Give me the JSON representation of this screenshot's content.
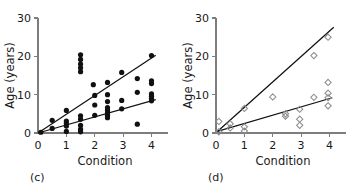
{
  "figure": {
    "panels": [
      {
        "tag": "(c)",
        "marker_style": "filled-circle",
        "xlabel": "Condition",
        "ylabel": "Age (years)",
        "xticks": [
          0,
          1,
          2,
          3,
          4
        ],
        "yticks": [
          0,
          10,
          20,
          30
        ],
        "xlim": [
          0,
          4.3
        ],
        "ylim": [
          0,
          30
        ],
        "lines": [
          {
            "name": "upper-regression",
            "x0": 0,
            "y0": 0,
            "x1": 4.15,
            "y1": 20.3
          },
          {
            "name": "lower-regression",
            "x0": 0,
            "y0": 0,
            "x1": 4.15,
            "y1": 8.7
          }
        ],
        "points": [
          [
            0.1,
            0.2
          ],
          [
            0.5,
            3.3
          ],
          [
            0.5,
            1.2
          ],
          [
            1.0,
            5.9
          ],
          [
            1.0,
            3.1
          ],
          [
            1.0,
            2.5
          ],
          [
            1.0,
            1.8
          ],
          [
            1.0,
            0.4
          ],
          [
            1.5,
            20.4
          ],
          [
            1.5,
            19.2
          ],
          [
            1.5,
            18.0
          ],
          [
            1.5,
            17.0
          ],
          [
            1.5,
            16.0
          ],
          [
            1.5,
            4.5
          ],
          [
            1.5,
            3.6
          ],
          [
            1.5,
            2.0
          ],
          [
            1.5,
            1.0
          ],
          [
            1.5,
            0.3
          ],
          [
            1.95,
            12.6
          ],
          [
            2.0,
            9.8
          ],
          [
            2.0,
            7.3
          ],
          [
            2.0,
            4.6
          ],
          [
            2.45,
            13.2
          ],
          [
            2.45,
            10.0
          ],
          [
            2.45,
            8.2
          ],
          [
            2.45,
            6.6
          ],
          [
            2.45,
            5.9
          ],
          [
            2.45,
            5.2
          ],
          [
            2.45,
            4.6
          ],
          [
            2.45,
            4.0
          ],
          [
            2.95,
            15.8
          ],
          [
            2.95,
            8.5
          ],
          [
            2.95,
            6.3
          ],
          [
            3.5,
            14.2
          ],
          [
            3.5,
            10.6
          ],
          [
            3.5,
            2.3
          ],
          [
            4.0,
            20.2
          ],
          [
            4.0,
            13.6
          ],
          [
            4.0,
            12.9
          ],
          [
            4.0,
            10.2
          ],
          [
            4.0,
            9.6
          ],
          [
            4.0,
            9.0
          ],
          [
            4.0,
            8.4
          ]
        ]
      },
      {
        "tag": "(d)",
        "marker_style": "open-diamond",
        "xlabel": "Condition",
        "ylabel": "Age (years)",
        "xticks": [
          0,
          1,
          2,
          3,
          4
        ],
        "yticks": [
          0,
          10,
          20,
          30
        ],
        "xlim": [
          0,
          4.3
        ],
        "ylim": [
          0,
          30
        ],
        "lines": [
          {
            "name": "upper-regression",
            "x0": 0.05,
            "y0": 0.4,
            "x1": 4.15,
            "y1": 27.6
          },
          {
            "name": "lower-regression",
            "x0": 0.05,
            "y0": 0.4,
            "x1": 4.1,
            "y1": 9.2
          }
        ],
        "points": [
          [
            0.1,
            3.0
          ],
          [
            0.1,
            0.3
          ],
          [
            0.5,
            2.4
          ],
          [
            0.5,
            1.3
          ],
          [
            1.0,
            6.4
          ],
          [
            1.0,
            1.6
          ],
          [
            1.0,
            0.5
          ],
          [
            2.0,
            9.4
          ],
          [
            2.45,
            5.0
          ],
          [
            2.45,
            4.4
          ],
          [
            2.95,
            6.2
          ],
          [
            2.95,
            3.6
          ],
          [
            2.95,
            2.0
          ],
          [
            3.45,
            20.2
          ],
          [
            3.45,
            9.3
          ],
          [
            3.95,
            25.0
          ],
          [
            3.95,
            13.2
          ],
          [
            3.95,
            10.4
          ],
          [
            3.95,
            9.2
          ],
          [
            3.95,
            7.1
          ]
        ]
      }
    ]
  },
  "chart_data": {
    "type": "scatter",
    "title": "",
    "panels": [
      {
        "label": "(c)",
        "title": "",
        "xlabel": "Condition",
        "ylabel": "Age (years)",
        "xlim": [
          0,
          4.3
        ],
        "ylim": [
          0,
          30
        ],
        "xticks": [
          0,
          1,
          2,
          3,
          4
        ],
        "yticks": [
          0,
          10,
          20,
          30
        ],
        "grid": false,
        "legend": "none",
        "marker": "filled circle",
        "series": [
          {
            "name": "observations",
            "x": [
              0.1,
              0.5,
              0.5,
              1.0,
              1.0,
              1.0,
              1.0,
              1.0,
              1.5,
              1.5,
              1.5,
              1.5,
              1.5,
              1.5,
              1.5,
              1.5,
              1.5,
              1.5,
              1.95,
              2.0,
              2.0,
              2.0,
              2.45,
              2.45,
              2.45,
              2.45,
              2.45,
              2.45,
              2.45,
              2.45,
              2.95,
              2.95,
              2.95,
              3.5,
              3.5,
              3.5,
              4.0,
              4.0,
              4.0,
              4.0,
              4.0,
              4.0,
              4.0
            ],
            "y": [
              0.2,
              3.3,
              1.2,
              5.9,
              3.1,
              2.5,
              1.8,
              0.4,
              20.4,
              19.2,
              18.0,
              17.0,
              16.0,
              4.5,
              3.6,
              2.0,
              1.0,
              0.3,
              12.6,
              9.8,
              7.3,
              4.6,
              13.2,
              10.0,
              8.2,
              6.6,
              5.9,
              5.2,
              4.6,
              4.0,
              15.8,
              8.5,
              6.3,
              14.2,
              10.6,
              2.3,
              20.2,
              13.6,
              12.9,
              10.2,
              9.6,
              9.0,
              8.4
            ]
          }
        ],
        "fit_lines": [
          {
            "name": "upper regression line",
            "slope": 4.89,
            "intercept": 0.0
          },
          {
            "name": "lower regression line",
            "slope": 2.1,
            "intercept": 0.0
          }
        ]
      },
      {
        "label": "(d)",
        "title": "",
        "xlabel": "Condition",
        "ylabel": "Age (years)",
        "xlim": [
          0,
          4.3
        ],
        "ylim": [
          0,
          30
        ],
        "xticks": [
          0,
          1,
          2,
          3,
          4
        ],
        "yticks": [
          0,
          10,
          20,
          30
        ],
        "grid": false,
        "legend": "none",
        "marker": "open diamond",
        "series": [
          {
            "name": "observations",
            "x": [
              0.1,
              0.1,
              0.5,
              0.5,
              1.0,
              1.0,
              1.0,
              2.0,
              2.45,
              2.45,
              2.95,
              2.95,
              2.95,
              3.45,
              3.45,
              3.95,
              3.95,
              3.95,
              3.95,
              3.95
            ],
            "y": [
              3.0,
              0.3,
              2.4,
              1.3,
              6.4,
              1.6,
              0.5,
              9.4,
              5.0,
              4.4,
              6.2,
              3.6,
              2.0,
              20.2,
              9.3,
              25.0,
              13.2,
              10.4,
              9.2,
              7.1
            ]
          }
        ],
        "fit_lines": [
          {
            "name": "upper regression line",
            "slope": 6.63,
            "intercept": 0.07
          },
          {
            "name": "lower regression line",
            "slope": 2.17,
            "intercept": 0.29
          }
        ]
      }
    ]
  }
}
